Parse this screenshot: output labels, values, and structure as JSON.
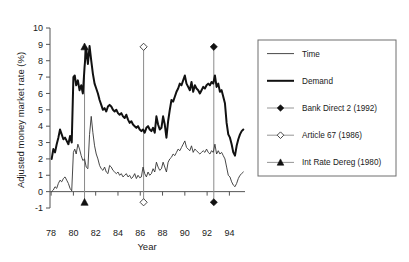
{
  "chart_data": {
    "type": "line",
    "title": "",
    "xlabel": "Year",
    "ylabel": "Adjusted money market rate (%)",
    "xlim": [
      77.9,
      95.4
    ],
    "ylim": [
      -1,
      10
    ],
    "grid": false,
    "legend_position": "right-outside",
    "xticks": [
      78,
      80,
      82,
      84,
      86,
      88,
      90,
      92,
      94
    ],
    "xtick_labels": [
      "78",
      "80",
      "82",
      "84",
      "86",
      "88",
      "90",
      "92",
      "94"
    ],
    "yticks": [
      -1,
      0,
      1,
      2,
      3,
      4,
      5,
      6,
      7,
      8,
      9,
      10
    ],
    "ytick_labels": [
      "-1",
      "0",
      "1",
      "2",
      "3",
      "4",
      "5",
      "6",
      "7",
      "8",
      "9",
      "10"
    ],
    "series": [
      {
        "name": "Demand",
        "style": "thick-line",
        "color": "#111111",
        "x": [
          78.05,
          78.2,
          78.35,
          78.5,
          78.65,
          78.8,
          78.95,
          79.1,
          79.25,
          79.4,
          79.55,
          79.7,
          79.85,
          80.0,
          80.12,
          80.25,
          80.4,
          80.55,
          80.7,
          80.85,
          81.0,
          81.15,
          81.3,
          81.45,
          81.6,
          81.75,
          81.9,
          82.05,
          82.2,
          82.35,
          82.5,
          82.65,
          82.8,
          82.95,
          83.1,
          83.25,
          83.4,
          83.55,
          83.7,
          83.85,
          84.0,
          84.15,
          84.3,
          84.45,
          84.6,
          84.75,
          84.9,
          85.05,
          85.2,
          85.35,
          85.5,
          85.65,
          85.8,
          85.95,
          86.1,
          86.25,
          86.4,
          86.55,
          86.7,
          86.85,
          87.0,
          87.15,
          87.3,
          87.45,
          87.6,
          87.75,
          87.9,
          88.05,
          88.2,
          88.35,
          88.5,
          88.65,
          88.8,
          88.95,
          89.1,
          89.25,
          89.4,
          89.55,
          89.7,
          89.85,
          90.0,
          90.15,
          90.3,
          90.45,
          90.6,
          90.75,
          90.9,
          91.05,
          91.2,
          91.35,
          91.5,
          91.65,
          91.8,
          91.95,
          92.1,
          92.25,
          92.4,
          92.55,
          92.7,
          92.85,
          93.0,
          93.15,
          93.3,
          93.45,
          93.6,
          93.75,
          93.9,
          94.05,
          94.2,
          94.35,
          94.5,
          94.65,
          94.8,
          94.95,
          95.1,
          95.25
        ],
        "y": [
          2.0,
          2.6,
          2.4,
          2.9,
          3.3,
          3.8,
          3.5,
          3.2,
          3.3,
          3.1,
          2.9,
          3.4,
          3.0,
          7.0,
          7.1,
          6.5,
          6.8,
          6.2,
          6.5,
          6.0,
          7.6,
          8.8,
          7.8,
          8.9,
          8.0,
          7.2,
          6.6,
          6.3,
          6.0,
          5.6,
          5.3,
          5.0,
          5.1,
          4.9,
          5.2,
          5.3,
          5.2,
          5.0,
          4.9,
          5.0,
          4.8,
          4.7,
          4.8,
          4.6,
          4.5,
          4.7,
          4.4,
          4.2,
          4.3,
          4.1,
          4.0,
          3.9,
          4.0,
          3.8,
          3.7,
          3.8,
          3.6,
          3.9,
          4.0,
          3.8,
          3.7,
          3.9,
          3.6,
          4.6,
          4.1,
          3.8,
          3.9,
          4.6,
          4.1,
          3.3,
          4.3,
          5.0,
          5.6,
          5.5,
          5.8,
          6.1,
          6.3,
          6.6,
          6.5,
          6.8,
          7.1,
          6.6,
          6.4,
          6.2,
          6.7,
          6.1,
          6.5,
          6.3,
          6.2,
          6.0,
          6.2,
          6.4,
          6.3,
          6.5,
          6.6,
          6.5,
          6.7,
          6.6,
          7.1,
          6.4,
          6.6,
          6.1,
          6.2,
          5.8,
          5.4,
          4.2,
          3.5,
          3.3,
          2.9,
          2.4,
          2.2,
          2.8,
          3.2,
          3.5,
          3.7,
          3.8
        ]
      },
      {
        "name": "Time",
        "style": "thin-line",
        "color": "#333333",
        "x": [
          78.05,
          78.2,
          78.35,
          78.5,
          78.65,
          78.8,
          78.95,
          79.1,
          79.25,
          79.4,
          79.55,
          79.7,
          79.85,
          80.0,
          80.12,
          80.25,
          80.4,
          80.55,
          80.7,
          80.85,
          81.0,
          81.15,
          81.3,
          81.45,
          81.6,
          81.75,
          81.9,
          82.05,
          82.2,
          82.35,
          82.5,
          82.65,
          82.8,
          82.95,
          83.1,
          83.25,
          83.4,
          83.55,
          83.7,
          83.85,
          84.0,
          84.15,
          84.3,
          84.45,
          84.6,
          84.75,
          84.9,
          85.05,
          85.2,
          85.35,
          85.5,
          85.65,
          85.8,
          85.95,
          86.1,
          86.25,
          86.4,
          86.55,
          86.7,
          86.85,
          87.0,
          87.15,
          87.3,
          87.45,
          87.6,
          87.75,
          87.9,
          88.05,
          88.2,
          88.35,
          88.5,
          88.65,
          88.8,
          88.95,
          89.1,
          89.25,
          89.4,
          89.55,
          89.7,
          89.85,
          90.0,
          90.15,
          90.3,
          90.45,
          90.6,
          90.75,
          90.9,
          91.05,
          91.2,
          91.35,
          91.5,
          91.65,
          91.8,
          91.95,
          92.1,
          92.25,
          92.4,
          92.55,
          92.7,
          92.85,
          93.0,
          93.15,
          93.3,
          93.45,
          93.6,
          93.75,
          93.9,
          94.05,
          94.2,
          94.35,
          94.5,
          94.65,
          94.8,
          94.95,
          95.1,
          95.25
        ],
        "y": [
          0.0,
          0.1,
          0.3,
          0.2,
          0.5,
          0.7,
          0.6,
          0.8,
          0.9,
          0.7,
          0.5,
          0.2,
          0.05,
          2.4,
          2.6,
          2.3,
          2.9,
          2.6,
          2.2,
          1.9,
          2.0,
          1.5,
          1.4,
          3.5,
          4.6,
          3.6,
          2.8,
          2.3,
          2.0,
          1.6,
          1.4,
          1.3,
          1.5,
          1.2,
          1.1,
          1.6,
          1.5,
          1.3,
          1.2,
          1.1,
          1.2,
          1.0,
          1.1,
          0.9,
          1.0,
          1.1,
          0.9,
          1.0,
          0.8,
          0.9,
          1.1,
          0.8,
          1.0,
          0.85,
          0.9,
          1.5,
          1.1,
          0.9,
          1.2,
          1.0,
          1.1,
          1.4,
          1.2,
          1.8,
          1.5,
          1.3,
          1.4,
          1.8,
          1.5,
          1.2,
          1.8,
          2.0,
          2.1,
          2.3,
          2.2,
          2.4,
          2.6,
          2.5,
          2.7,
          2.9,
          3.1,
          2.7,
          2.6,
          2.5,
          2.8,
          2.4,
          2.6,
          2.5,
          2.4,
          2.3,
          2.4,
          2.5,
          2.4,
          2.6,
          2.4,
          2.3,
          2.5,
          2.4,
          2.9,
          2.3,
          2.5,
          2.3,
          2.4,
          2.2,
          2.0,
          1.5,
          1.0,
          0.9,
          0.6,
          0.4,
          0.3,
          0.5,
          0.8,
          1.0,
          1.1,
          1.2
        ]
      }
    ],
    "events": [
      {
        "name": "Int Rate Dereg (1980)",
        "label": "Int Rate Dereg (1980)",
        "x": 81.0,
        "marker": "filled-triangle",
        "y_top": 8.85,
        "y_bottom": -0.65
      },
      {
        "name": "Article 67 (1986)",
        "label": "Article 67 (1986)",
        "x": 86.3,
        "marker": "open-diamond",
        "y_top": 8.85,
        "y_bottom": -0.65
      },
      {
        "name": "Bank Direct 2 (1992)",
        "label": "Bank Direct 2 (1992)",
        "x": 92.6,
        "marker": "filled-diamond",
        "y_top": 8.85,
        "y_bottom": -0.65
      }
    ],
    "legend": [
      {
        "label": "Time",
        "marker": "thin-line"
      },
      {
        "label": "Demand",
        "marker": "thick-line"
      },
      {
        "label": "Bank Direct 2 (1992)",
        "marker": "filled-diamond"
      },
      {
        "label": "Article 67 (1986)",
        "marker": "open-diamond"
      },
      {
        "label": "Int Rate Dereg (1980)",
        "marker": "filled-triangle"
      }
    ]
  }
}
